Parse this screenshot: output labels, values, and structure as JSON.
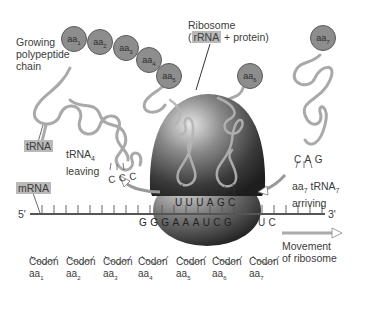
{
  "labels": {
    "growing_chain": [
      "Growing",
      "polypeptide",
      "chain"
    ],
    "ribosome_title": "Ribosome",
    "ribosome_rrna": "rRNA",
    "ribosome_rest": "+ protein)",
    "ribosome_open": "(",
    "trna": "tRNA",
    "trna4_leaving": [
      "tRNA",
      "4",
      "leaving"
    ],
    "mrna": "mRNA",
    "five_prime": "5'",
    "three_prime": "3'",
    "aa7_arriving": [
      "aa",
      "7",
      " tRNA",
      "7",
      "arriving"
    ],
    "movement": [
      "Movement",
      "of ribosome"
    ]
  },
  "amino_acids": [
    {
      "name": "aa",
      "sub": "1"
    },
    {
      "name": "aa",
      "sub": "2"
    },
    {
      "name": "aa",
      "sub": "3"
    },
    {
      "name": "aa",
      "sub": "4"
    },
    {
      "name": "aa",
      "sub": "5"
    },
    {
      "name": "aa",
      "sub": "6"
    },
    {
      "name": "aa",
      "sub": "7"
    }
  ],
  "sequences": {
    "leaving_anticodon": "CCC",
    "arriving_anticodon": "CAG",
    "ribosome_anticodons": "UUUAGC",
    "mrna_visible": "GGGAAAUCG",
    "mrna_tail": "UC"
  },
  "codons": [
    {
      "label": "Codon",
      "aa": "aa",
      "sub": "1"
    },
    {
      "label": "Codon",
      "aa": "aa",
      "sub": "2"
    },
    {
      "label": "Codon",
      "aa": "aa",
      "sub": "3"
    },
    {
      "label": "Codon",
      "aa": "aa",
      "sub": "4"
    },
    {
      "label": "Codon",
      "aa": "aa",
      "sub": "5"
    },
    {
      "label": "Codon",
      "aa": "aa",
      "sub": "6"
    },
    {
      "label": "Codon",
      "aa": "aa",
      "sub": "7"
    }
  ],
  "colors": {
    "amino_acid_fill": "#8d8d8d",
    "label_highlight": "#b9b9b9",
    "trna_strand": "#a9a9a9",
    "ribosome_dark": "#2a2a2a",
    "ribosome_light": "#d9d9d9"
  }
}
